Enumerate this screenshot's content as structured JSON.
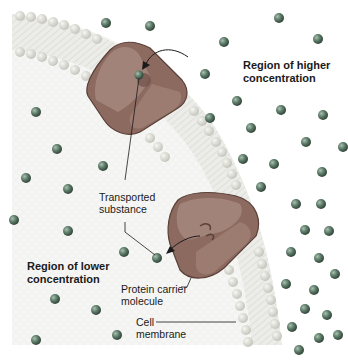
{
  "diagram": {
    "type": "facilitated diffusion via carrier protein",
    "labels": {
      "higher": [
        "Region of higher",
        "concentration"
      ],
      "lower": [
        "Region of lower",
        "concentration"
      ],
      "transported": [
        "Transported",
        "substance"
      ],
      "protein": [
        "Protein carrier",
        "molecule"
      ],
      "membrane": [
        "Cell",
        "membrane"
      ]
    },
    "colors": {
      "background_extracellular": "#ffffff",
      "cytoplasm_fill": "#eeeeec",
      "phospholipid_head": "#dcdcd6",
      "phospholipid_tail": "#e8e8e4",
      "protein_fill": "#8c6a60",
      "protein_light": "#a88a80",
      "protein_stroke": "#5a4038",
      "particle": "#4e6a58",
      "particle_highlight": "#9fb5a6",
      "line": "#222222"
    }
  }
}
